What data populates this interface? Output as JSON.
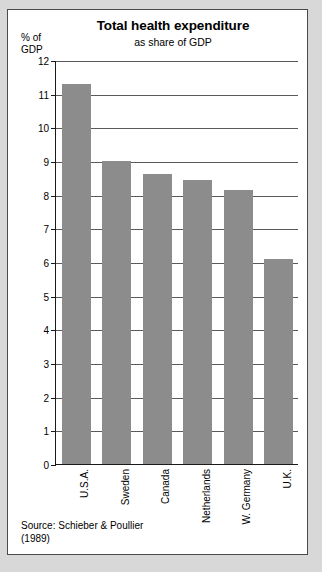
{
  "chart_data": {
    "type": "bar",
    "title": "Total health expenditure",
    "subtitle": "as share of GDP",
    "ylabel": "% of\nGDP",
    "xlabel": "",
    "categories": [
      "U.S.A.",
      "Sweden",
      "Canada",
      "Netherlands",
      "W. Germany",
      "U.K."
    ],
    "values": [
      11.3,
      9.0,
      8.6,
      8.45,
      8.15,
      6.1
    ],
    "ylim": [
      0,
      12
    ],
    "yticks": [
      0,
      1,
      2,
      3,
      4,
      5,
      6,
      7,
      8,
      9,
      10,
      11,
      12
    ],
    "ytick_labels": [
      "0",
      "1",
      "2",
      "3",
      "4",
      "5",
      "6",
      "7",
      "8",
      "9",
      "10",
      "11",
      "12"
    ],
    "grid": true,
    "legend": false,
    "bar_color": "#8c8c8c",
    "axis_color": "#1a1a1a",
    "grid_color": "#5a5a5a"
  },
  "footer": {
    "source": "Source: Schieber & Poullier\n(1989)"
  }
}
